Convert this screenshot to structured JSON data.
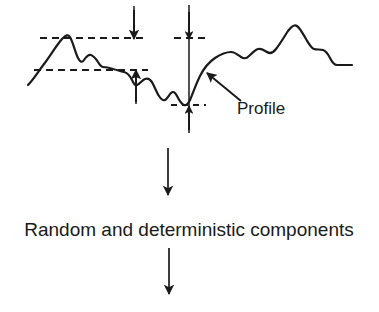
{
  "figure": {
    "type": "flow-diagram",
    "background_color": "#ffffff",
    "ink_color": "#1a1a1a",
    "labels": {
      "profile": "Profile",
      "stage_one": "Random and deterministic components"
    },
    "annotations": {
      "profile_callout": "Profile",
      "flow_step_1": "Random and deterministic components"
    },
    "icons": [
      "surface-profile-trace",
      "dashed-reference-line",
      "dimension-arrow",
      "callout-leader-arrow",
      "flow-arrow-down"
    ],
    "reference_lines": [
      {
        "name": "peak-reference-line",
        "y": 38,
        "x1": 40,
        "x2": 146
      },
      {
        "name": "upper-mid-reference-line",
        "y": 70,
        "x1": 35,
        "x2": 147
      },
      {
        "name": "peak-reference-line-right",
        "y": 38,
        "x1": 175,
        "x2": 207
      },
      {
        "name": "valley-reference-line",
        "y": 105,
        "x1": 172,
        "x2": 205
      }
    ],
    "dimension_arrows": [
      {
        "name": "peak-height-arrow",
        "x": 134,
        "y1": 8,
        "y2": 40
      },
      {
        "name": "mean-depth-arrow",
        "x": 137,
        "y1": 100,
        "y2": 68
      },
      {
        "name": "total-height-arrow-top",
        "x": 189,
        "y1": 5,
        "y2": 40
      },
      {
        "name": "total-height-arrow-bottom",
        "x": 189,
        "y1": 128,
        "y2": 103
      }
    ],
    "flow_arrows": [
      {
        "name": "flow-arrow-1",
        "x": 168,
        "y1": 148,
        "y2": 197
      },
      {
        "name": "flow-arrow-2",
        "x": 169,
        "y1": 248,
        "y2": 296
      }
    ],
    "profile_curve": {
      "name": "surface-profile-trace",
      "path": "M 28,85 C 33,80 38,72 44,64 C 50,56 56,46 62,39 C 66,35 68,34 70,37 C 73,42 75,52 78,58 C 80,62 82,63 84,60 C 86,57 88,54 91,55 C 94,56 96,59 98,62 C 100,65 101,67 103,67 C 106,67 110,68 113,69 C 117,70 120,71 124,72 C 128,73 130,76 132,80 C 134,84 135,86 137,85 C 140,84 142,80 145,79 C 148,78 151,80 153,84 C 155,88 157,93 159,96 C 161,99 163,101 165,100 C 167,99 169,95 171,93 C 173,91 175,92 177,96 C 179,100 181,104 184,105 C 186,106 188,104 190,100 C 193,93 196,84 200,76 C 204,68 209,62 215,58 C 221,54 226,52 231,52 C 235,52 238,55 241,57 C 244,59 246,59 249,56 C 252,53 255,50 258,49 C 261,48 264,50 267,52 C 270,54 273,53 276,49 C 280,44 284,37 288,31 C 291,27 294,24 297,26 C 300,28 303,34 306,39 C 309,44 311,48 314,49 C 317,50 320,49 323,50 C 326,51 328,54 330,58 C 332,62 334,65 337,65 C 341,65 346,65 352,65"
    },
    "callout_leader": {
      "name": "profile-callout-leader",
      "from": [
        241,
        101
      ],
      "to": [
        205,
        72
      ]
    }
  }
}
